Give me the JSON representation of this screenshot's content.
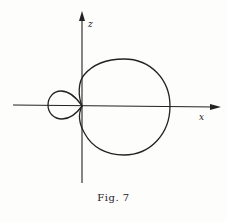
{
  "figure": {
    "caption": "Fig. 7",
    "axes": {
      "vertical_label": "z",
      "horizontal_label": "x"
    },
    "curves": [
      {
        "name": "large-lobe",
        "description": "large closed loop to the right of the z-axis, passing through origin"
      },
      {
        "name": "small-lobe",
        "description": "small closed loop to the left of the z-axis, touching origin"
      }
    ],
    "colors": {
      "ink": "#222222",
      "paper": "#fdfdfb"
    }
  }
}
